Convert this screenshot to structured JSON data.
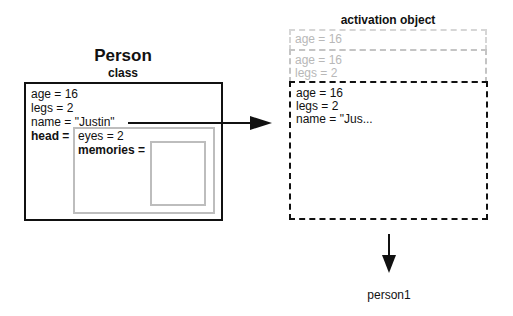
{
  "person_class": {
    "title": "Person",
    "subtitle": "class",
    "fields": [
      {
        "label": "age = 16"
      },
      {
        "label": "legs = 2"
      },
      {
        "label": "name = \"Justin\""
      }
    ],
    "head_label": "head =",
    "head": {
      "eyes": "eyes = 2",
      "memories_label": "memories ="
    }
  },
  "activation_object": {
    "title": "activation object",
    "ghost_frame_1": [
      "age = 16"
    ],
    "ghost_frame_2": [
      "age = 16",
      "legs = 2"
    ],
    "current_frame": [
      "age = 16",
      "legs = 2",
      "name = \"Jus..."
    ]
  },
  "output": {
    "label": "person1"
  }
}
